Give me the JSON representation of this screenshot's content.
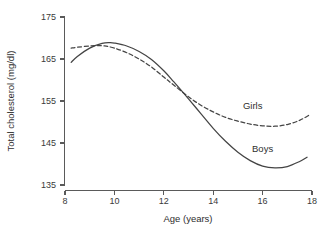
{
  "chart_data": {
    "type": "line",
    "title": "",
    "xlabel": "Age (years)",
    "ylabel": "Total cholesterol (mg/dl)",
    "xlim": [
      8,
      18
    ],
    "ylim": [
      135,
      175
    ],
    "xticks": [
      8,
      10,
      12,
      14,
      16,
      18
    ],
    "yticks": [
      135,
      145,
      155,
      165,
      175
    ],
    "grid": false,
    "legend_position": "inline-labels",
    "line_color": "#444444",
    "series": [
      {
        "name": "Boys",
        "style": "solid",
        "label_position": {
          "x": 16.0,
          "y": 142.8
        },
        "x": [
          8.25,
          8.5,
          9.0,
          9.5,
          9.8,
          10.0,
          10.5,
          11.0,
          11.5,
          12.0,
          12.4,
          13.0,
          13.5,
          14.0,
          14.5,
          15.0,
          15.5,
          16.0,
          16.5,
          17.0,
          17.5,
          17.8
        ],
        "values": [
          164.2,
          165.6,
          167.6,
          168.7,
          168.9,
          168.8,
          168.1,
          166.8,
          164.9,
          162.2,
          159.6,
          155.5,
          152.0,
          148.5,
          145.4,
          142.8,
          140.8,
          139.5,
          139.1,
          139.4,
          140.6,
          141.6
        ]
      },
      {
        "name": "Girls",
        "style": "dashed",
        "label_position": {
          "x": 15.6,
          "y": 153.2
        },
        "x": [
          8.25,
          8.5,
          9.0,
          9.3,
          9.6,
          10.0,
          10.5,
          11.0,
          11.5,
          12.0,
          12.4,
          13.0,
          13.5,
          14.0,
          14.5,
          15.0,
          15.5,
          16.0,
          16.5,
          17.0,
          17.5,
          17.9
        ],
        "values": [
          167.6,
          167.8,
          168.1,
          168.2,
          168.1,
          167.6,
          166.5,
          165.0,
          163.1,
          160.7,
          158.8,
          156.0,
          154.0,
          152.4,
          151.1,
          150.2,
          149.5,
          149.1,
          149.0,
          149.4,
          150.4,
          151.7
        ]
      }
    ]
  }
}
